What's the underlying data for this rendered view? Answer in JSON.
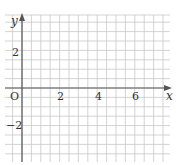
{
  "diagram": {
    "type": "coordinate-grid",
    "axes": {
      "x_label": "x",
      "y_label": "y",
      "origin_label": "O"
    },
    "x_ticks": [
      {
        "value": 2,
        "label": "2"
      },
      {
        "value": 4,
        "label": "4"
      },
      {
        "value": 6,
        "label": "6"
      }
    ],
    "y_ticks": [
      {
        "value": 2,
        "label": "2"
      },
      {
        "value": -2,
        "label": "−2"
      }
    ],
    "grid": {
      "cells_per_unit": 2,
      "x_range": [
        -1,
        7.5
      ],
      "y_range": [
        -3.7,
        4
      ]
    },
    "colors": {
      "grid": "#c8c8c8",
      "axis": "#555555",
      "label": "#333333"
    }
  }
}
